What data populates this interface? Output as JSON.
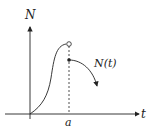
{
  "labels": {
    "y_axis": "N",
    "x_axis": "t",
    "x_tick": "a",
    "curve": "N(t)"
  },
  "colors": {
    "ink": "#222222"
  }
}
